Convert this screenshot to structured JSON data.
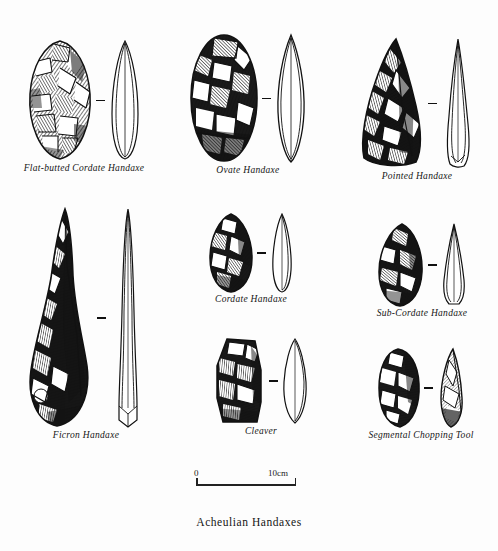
{
  "plate": {
    "title": "Acheulian Handaxes",
    "scale": {
      "left_label": "0",
      "right_label": "10cm"
    },
    "separator_glyph": "dash"
  },
  "figures": [
    {
      "id": "flat-butted-cordate-handaxe",
      "caption": "Flat-butted Cordate Handaxe",
      "face_view": "stippled-flaked-teardrop",
      "profile_view": "narrow-lens-outline"
    },
    {
      "id": "ovate-handaxe",
      "caption": "Ovate Handaxe",
      "face_view": "stippled-flaked-oval",
      "profile_view": "pointed-lens-outline"
    },
    {
      "id": "pointed-handaxe",
      "caption": "Pointed Handaxe",
      "face_view": "stippled-flaked-triangular",
      "profile_view": "slender-spike-outline"
    },
    {
      "id": "cordate-handaxe",
      "caption": "Cordate Handaxe",
      "face_view": "stippled-flaked-cordate",
      "profile_view": "narrow-leaf-outline"
    },
    {
      "id": "sub-cordate-handaxe",
      "caption": "Sub-Cordate Handaxe",
      "face_view": "stippled-flaked-sub-cordate",
      "profile_view": "tapered-diamond-outline"
    },
    {
      "id": "ficron-handaxe",
      "caption": "Ficron Handaxe",
      "face_view": "stippled-flaked-elongate-pear",
      "profile_view": "long-spike-outline"
    },
    {
      "id": "cleaver",
      "caption": "Cleaver",
      "face_view": "stippled-flaked-rectangular",
      "profile_view": "broad-lens-outline"
    },
    {
      "id": "segmental-chopping-tool",
      "caption": "Segmental Chopping Tool",
      "face_view": "stippled-flaked-rounded-block",
      "profile_view": "shaded-wedge-side"
    }
  ]
}
